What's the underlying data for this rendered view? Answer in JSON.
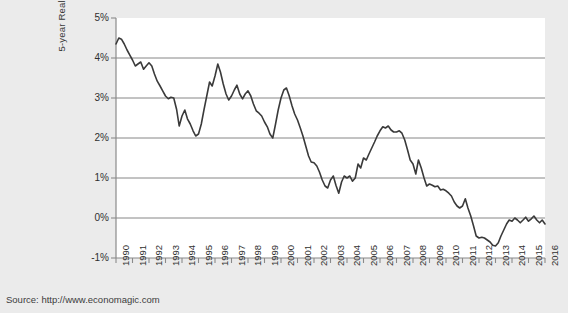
{
  "figure": {
    "background_color": "#ebebeb",
    "plot_background_color": "#ffffff",
    "line_color": "#3a3a3a",
    "grid_color": "#787878",
    "axis_color": "#8a8a8a"
  },
  "source_note": "Source: http://www.economagic.com",
  "chart_data": {
    "type": "line",
    "title": "",
    "subtitle": "",
    "xlabel": "",
    "ylabel": "5-year Real Interest Rate",
    "xlim": [
      1990,
      2016
    ],
    "ylim": [
      -1,
      5
    ],
    "ytick_labels": [
      "5%",
      "4%",
      "3%",
      "2%",
      "1%",
      "0%",
      "-1%"
    ],
    "ytick_values": [
      5,
      4,
      3,
      2,
      1,
      0,
      -1
    ],
    "ytick_unit": "percent",
    "grid": "horizontal",
    "gridlines_at": [
      4,
      3,
      2,
      1,
      0
    ],
    "legend": "none",
    "xtick_labels": [
      "1990",
      "1991",
      "1992",
      "1993",
      "1994",
      "1995",
      "1996",
      "1997",
      "1998",
      "1999",
      "2000",
      "2001",
      "2002",
      "2003",
      "2004",
      "2005",
      "2006",
      "2007",
      "2008",
      "2009",
      "2010",
      "2011",
      "2012",
      "2013",
      "2014",
      "2015",
      "2016"
    ],
    "xtick_values": [
      1990,
      1991,
      1992,
      1993,
      1994,
      1995,
      1996,
      1997,
      1998,
      1999,
      2000,
      2001,
      2002,
      2003,
      2004,
      2005,
      2006,
      2007,
      2008,
      2009,
      2010,
      2011,
      2012,
      2013,
      2014,
      2015,
      2016
    ],
    "series": [
      {
        "name": "5-year Real Interest Rate",
        "color": "#3a3a3a",
        "x": [
          1990.0,
          1990.17,
          1990.33,
          1990.5,
          1990.67,
          1990.83,
          1991.0,
          1991.17,
          1991.33,
          1991.5,
          1991.67,
          1991.83,
          1992.0,
          1992.17,
          1992.33,
          1992.5,
          1992.67,
          1992.83,
          1993.0,
          1993.17,
          1993.33,
          1993.5,
          1993.67,
          1993.83,
          1994.0,
          1994.17,
          1994.33,
          1994.5,
          1994.67,
          1994.83,
          1995.0,
          1995.17,
          1995.33,
          1995.5,
          1995.67,
          1995.83,
          1996.0,
          1996.17,
          1996.33,
          1996.5,
          1996.67,
          1996.83,
          1997.0,
          1997.17,
          1997.33,
          1997.5,
          1997.67,
          1997.83,
          1998.0,
          1998.17,
          1998.33,
          1998.5,
          1998.67,
          1998.83,
          1999.0,
          1999.17,
          1999.33,
          1999.5,
          1999.67,
          1999.83,
          2000.0,
          2000.17,
          2000.33,
          2000.5,
          2000.67,
          2000.83,
          2001.0,
          2001.17,
          2001.33,
          2001.5,
          2001.67,
          2001.83,
          2002.0,
          2002.17,
          2002.33,
          2002.5,
          2002.67,
          2002.83,
          2003.0,
          2003.17,
          2003.33,
          2003.5,
          2003.67,
          2003.83,
          2004.0,
          2004.17,
          2004.33,
          2004.5,
          2004.67,
          2004.83,
          2005.0,
          2005.17,
          2005.33,
          2005.5,
          2005.67,
          2005.83,
          2006.0,
          2006.17,
          2006.33,
          2006.5,
          2006.67,
          2006.83,
          2007.0,
          2007.17,
          2007.33,
          2007.5,
          2007.67,
          2007.83,
          2008.0,
          2008.17,
          2008.33,
          2008.5,
          2008.67,
          2008.83,
          2009.0,
          2009.17,
          2009.33,
          2009.5,
          2009.67,
          2009.83,
          2010.0,
          2010.17,
          2010.33,
          2010.5,
          2010.67,
          2010.83,
          2011.0,
          2011.17,
          2011.33,
          2011.5,
          2011.67,
          2011.83,
          2012.0,
          2012.17,
          2012.33,
          2012.5,
          2012.67,
          2012.83,
          2013.0,
          2013.17,
          2013.33,
          2013.5,
          2013.67,
          2013.83,
          2014.0,
          2014.17,
          2014.33,
          2014.5,
          2014.67,
          2014.83,
          2015.0,
          2015.17,
          2015.33,
          2015.5,
          2015.67,
          2015.83,
          2016.0
        ],
        "values": [
          4.35,
          4.5,
          4.47,
          4.35,
          4.2,
          4.08,
          3.95,
          3.8,
          3.85,
          3.9,
          3.72,
          3.8,
          3.88,
          3.8,
          3.6,
          3.42,
          3.3,
          3.18,
          3.05,
          2.98,
          3.02,
          3.0,
          2.72,
          2.3,
          2.55,
          2.7,
          2.48,
          2.35,
          2.18,
          2.05,
          2.1,
          2.35,
          2.7,
          3.05,
          3.4,
          3.3,
          3.55,
          3.85,
          3.65,
          3.35,
          3.1,
          2.95,
          3.05,
          3.2,
          3.32,
          3.1,
          2.98,
          3.1,
          3.18,
          3.05,
          2.85,
          2.68,
          2.62,
          2.55,
          2.4,
          2.28,
          2.1,
          2.0,
          2.35,
          2.7,
          3.0,
          3.2,
          3.25,
          3.05,
          2.8,
          2.6,
          2.45,
          2.25,
          2.05,
          1.8,
          1.55,
          1.4,
          1.38,
          1.3,
          1.15,
          0.95,
          0.8,
          0.75,
          0.95,
          1.05,
          0.82,
          0.62,
          0.9,
          1.05,
          1.0,
          1.05,
          0.92,
          1.0,
          1.35,
          1.25,
          1.5,
          1.45,
          1.6,
          1.75,
          1.9,
          2.05,
          2.18,
          2.28,
          2.25,
          2.3,
          2.2,
          2.15,
          2.15,
          2.18,
          2.12,
          1.95,
          1.7,
          1.45,
          1.35,
          1.1,
          1.45,
          1.25,
          1.0,
          0.8,
          0.85,
          0.82,
          0.78,
          0.8,
          0.7,
          0.72,
          0.68,
          0.62,
          0.55,
          0.4,
          0.3,
          0.25,
          0.3,
          0.48,
          0.25,
          0.05,
          -0.2,
          -0.45,
          -0.5,
          -0.48,
          -0.5,
          -0.55,
          -0.6,
          -0.68,
          -0.7,
          -0.62,
          -0.45,
          -0.3,
          -0.15,
          -0.05,
          -0.08,
          0.0,
          -0.05,
          -0.12,
          -0.05,
          0.02,
          -0.08,
          -0.02,
          0.05,
          -0.05,
          -0.12,
          -0.05,
          -0.15
        ]
      }
    ]
  }
}
